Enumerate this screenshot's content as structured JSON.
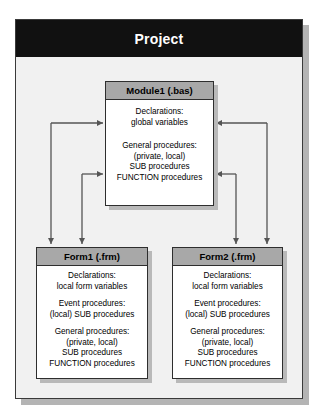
{
  "diagram": {
    "title": "Project",
    "frame_border_color": "#3a3a3a",
    "titlebar_color": "#111111",
    "header_fill_color": "#a8a8a8",
    "connector_color": "#555555"
  },
  "module": {
    "title": "Module1 (.bas)",
    "sections": [
      {
        "name": "declarations",
        "lines": [
          "Declarations:",
          "global variables"
        ]
      },
      {
        "name": "general-procedures",
        "lines": [
          "General procedures:",
          "(private, local)",
          "SUB procedures",
          "FUNCTION procedures"
        ]
      }
    ]
  },
  "forms": [
    {
      "id": "form1",
      "title": "Form1 (.frm)",
      "sections": [
        {
          "name": "declarations",
          "lines": [
            "Declarations:",
            "local form variables"
          ]
        },
        {
          "name": "event-procedures",
          "lines": [
            "Event procedures:",
            "(local) SUB procedures"
          ]
        },
        {
          "name": "general-procedures",
          "lines": [
            "General procedures:",
            "(private, local)",
            "SUB procedures",
            "FUNCTION procedures"
          ]
        }
      ]
    },
    {
      "id": "form2",
      "title": "Form2 (.frm)",
      "sections": [
        {
          "name": "declarations",
          "lines": [
            "Declarations:",
            "local form variables"
          ]
        },
        {
          "name": "event-procedures",
          "lines": [
            "Event procedures:",
            "(local) SUB procedures"
          ]
        },
        {
          "name": "general-procedures",
          "lines": [
            "General procedures:",
            "(private, local)",
            "SUB procedures",
            "FUNCTION procedures"
          ]
        }
      ]
    }
  ],
  "connectors": [
    {
      "name": "module-declarations-to-form1",
      "from": "module1-declarations",
      "to": "form1"
    },
    {
      "name": "module-general-to-form1",
      "from": "module1-general",
      "to": "form1"
    },
    {
      "name": "module-declarations-to-form2",
      "from": "module1-declarations",
      "to": "form2"
    },
    {
      "name": "module-general-to-form2",
      "from": "module1-general",
      "to": "form2"
    }
  ]
}
